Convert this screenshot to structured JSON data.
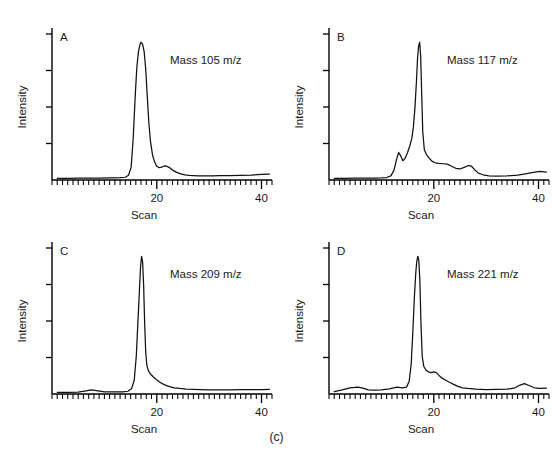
{
  "figure": {
    "caption": "(c)",
    "panel_count": 4
  },
  "chart_data": [
    {
      "type": "line",
      "panel_letter": "A",
      "title": "",
      "annotation": "Mass 105 m/z",
      "xlabel": "Scan",
      "ylabel": "Intensity",
      "xlim": [
        0,
        42
      ],
      "ylim": [
        0,
        1.06
      ],
      "xticks_major": [
        20,
        40
      ],
      "xtick_labels": [
        "20",
        "40"
      ],
      "xtick_minor_step": 1,
      "yticks_unlabeled": [
        0.25,
        0.5,
        0.75,
        1.0
      ],
      "grid": false,
      "legend": "none",
      "x": [
        1,
        3,
        5,
        7,
        9,
        11,
        12,
        13,
        14,
        14.6,
        15.1,
        15.5,
        15.9,
        16.2,
        16.5,
        16.8,
        17.0,
        17.3,
        17.6,
        17.9,
        18.2,
        18.5,
        18.8,
        19.2,
        19.6,
        20.0,
        20.4,
        20.8,
        21.3,
        21.8,
        22.4,
        23.0,
        23.8,
        24.6,
        25.4,
        26.2,
        27.0,
        28.0,
        29.0,
        30.5,
        32.0,
        34.0,
        36.0,
        38.0,
        40.0,
        41.5
      ],
      "y": [
        0.012,
        0.012,
        0.013,
        0.013,
        0.014,
        0.015,
        0.016,
        0.017,
        0.02,
        0.035,
        0.09,
        0.3,
        0.62,
        0.82,
        0.93,
        0.985,
        1.0,
        0.985,
        0.93,
        0.8,
        0.6,
        0.41,
        0.28,
        0.18,
        0.13,
        0.1,
        0.09,
        0.092,
        0.1,
        0.102,
        0.09,
        0.072,
        0.055,
        0.045,
        0.038,
        0.034,
        0.032,
        0.03,
        0.03,
        0.03,
        0.031,
        0.032,
        0.034,
        0.036,
        0.04,
        0.043
      ]
    },
    {
      "type": "line",
      "panel_letter": "B",
      "title": "",
      "annotation": "Mass 117 m/z",
      "xlabel": "Scan",
      "ylabel": "Intensity",
      "xlim": [
        0,
        42
      ],
      "ylim": [
        0,
        1.06
      ],
      "xticks_major": [
        20,
        40
      ],
      "xtick_labels": [
        "20",
        "40"
      ],
      "xtick_minor_step": 1,
      "yticks_unlabeled": [
        0.25,
        0.5,
        0.75,
        1.0
      ],
      "grid": false,
      "legend": "none",
      "x": [
        1,
        3,
        5,
        7,
        9,
        10,
        11,
        11.8,
        12.4,
        12.9,
        13.3,
        13.7,
        14.1,
        14.5,
        15.0,
        15.4,
        15.8,
        16.1,
        16.4,
        16.7,
        16.9,
        17.1,
        17.3,
        17.5,
        17.7,
        17.9,
        18.2,
        18.6,
        19.1,
        19.7,
        20.3,
        21.0,
        21.8,
        22.6,
        23.4,
        24.2,
        25.0,
        25.8,
        26.6,
        27.2,
        27.8,
        28.5,
        29.4,
        30.5,
        32.0,
        34.0,
        36.0,
        37.5,
        39.0,
        40.3,
        41.5
      ],
      "y": [
        0.012,
        0.012,
        0.013,
        0.013,
        0.014,
        0.015,
        0.018,
        0.03,
        0.07,
        0.15,
        0.2,
        0.175,
        0.14,
        0.155,
        0.2,
        0.245,
        0.3,
        0.38,
        0.52,
        0.72,
        0.88,
        0.97,
        1.0,
        0.9,
        0.62,
        0.35,
        0.22,
        0.185,
        0.16,
        0.135,
        0.125,
        0.12,
        0.118,
        0.115,
        0.1,
        0.085,
        0.08,
        0.092,
        0.105,
        0.1,
        0.075,
        0.05,
        0.038,
        0.03,
        0.028,
        0.03,
        0.035,
        0.045,
        0.055,
        0.062,
        0.058
      ]
    },
    {
      "type": "line",
      "panel_letter": "C",
      "title": "",
      "annotation": "Mass 209 m/z",
      "xlabel": "Scan",
      "ylabel": "Intensity",
      "xlim": [
        0,
        42
      ],
      "ylim": [
        0,
        1.06
      ],
      "xticks_major": [
        20,
        40
      ],
      "xtick_labels": [
        "20",
        "40"
      ],
      "xtick_minor_step": 1,
      "yticks_unlabeled": [
        0.25,
        0.5,
        0.75,
        1.0
      ],
      "grid": false,
      "legend": "none",
      "x": [
        1,
        3,
        5,
        6.5,
        7.5,
        8.5,
        10,
        12,
        13.5,
        14.5,
        15.2,
        15.7,
        16.1,
        16.4,
        16.7,
        16.9,
        17.1,
        17.3,
        17.5,
        17.7,
        17.9,
        18.1,
        18.4,
        18.8,
        19.3,
        19.9,
        20.6,
        21.4,
        22.3,
        23.3,
        24.4,
        25.6,
        27.0,
        28.5,
        30.0,
        32.0,
        34.0,
        36.0,
        38.0,
        40.0,
        41.5
      ],
      "y": [
        0.012,
        0.012,
        0.013,
        0.022,
        0.03,
        0.025,
        0.016,
        0.015,
        0.016,
        0.02,
        0.04,
        0.1,
        0.28,
        0.52,
        0.76,
        0.92,
        1.0,
        0.96,
        0.78,
        0.5,
        0.3,
        0.21,
        0.17,
        0.145,
        0.125,
        0.105,
        0.085,
        0.068,
        0.055,
        0.045,
        0.04,
        0.036,
        0.033,
        0.031,
        0.03,
        0.03,
        0.03,
        0.031,
        0.031,
        0.032,
        0.033
      ]
    },
    {
      "type": "line",
      "panel_letter": "D",
      "title": "",
      "annotation": "Mass 221 m/z",
      "xlabel": "Scan",
      "ylabel": "Intensity",
      "xlim": [
        0,
        42
      ],
      "ylim": [
        0,
        1.06
      ],
      "xticks_major": [
        20,
        40
      ],
      "xtick_labels": [
        "20",
        "40"
      ],
      "xtick_minor_step": 1,
      "yticks_unlabeled": [
        0.25,
        0.5,
        0.75,
        1.0
      ],
      "grid": false,
      "legend": "none",
      "x": [
        1,
        2.5,
        4,
        5.5,
        6.5,
        7.5,
        8.5,
        10,
        11.5,
        13,
        14,
        14.8,
        15.3,
        15.7,
        16.0,
        16.3,
        16.55,
        16.75,
        16.95,
        17.15,
        17.35,
        17.55,
        17.8,
        18.1,
        18.5,
        19.0,
        19.5,
        20.0,
        20.5,
        21.0,
        21.6,
        22.3,
        23.0,
        23.8,
        24.6,
        25.5,
        26.5,
        28.0,
        30.0,
        32.0,
        34.0,
        35.5,
        36.5,
        37.3,
        38.2,
        39.2,
        40.2,
        41.5
      ],
      "y": [
        0.018,
        0.03,
        0.045,
        0.05,
        0.042,
        0.03,
        0.028,
        0.03,
        0.038,
        0.05,
        0.045,
        0.05,
        0.09,
        0.22,
        0.45,
        0.7,
        0.87,
        0.96,
        1.0,
        0.97,
        0.82,
        0.52,
        0.27,
        0.2,
        0.175,
        0.16,
        0.155,
        0.16,
        0.155,
        0.135,
        0.115,
        0.1,
        0.085,
        0.07,
        0.055,
        0.045,
        0.04,
        0.035,
        0.032,
        0.033,
        0.035,
        0.045,
        0.065,
        0.075,
        0.062,
        0.045,
        0.04,
        0.042
      ]
    }
  ]
}
